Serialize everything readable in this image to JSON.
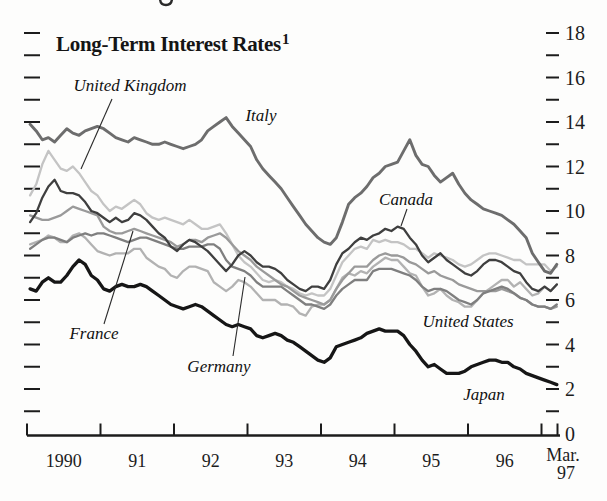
{
  "chart_data": {
    "type": "line",
    "title": "Long-Term Interest Rates",
    "title_footnote_marker": "1",
    "x_axis": {
      "year_labels": [
        "1990",
        "91",
        "92",
        "93",
        "94",
        "95",
        "96"
      ],
      "end_label_top": "Mar.",
      "end_label_bottom": "97",
      "months_shown": 87,
      "range": "Jan 1990 - Mar 1997"
    },
    "y_axis": {
      "min": 0,
      "max": 18,
      "minor_step": 1,
      "major_step": 2,
      "labels_side": "right",
      "labels": [
        "18",
        "16",
        "14",
        "12",
        "10",
        "8",
        "6",
        "4",
        "2",
        "0"
      ]
    },
    "series": [
      {
        "name": "united-kingdom",
        "label": "United Kingdom",
        "color": "#c4c4c4",
        "stroke_width": 2.3,
        "values": [
          10.7,
          11.2,
          12.1,
          12.7,
          12.3,
          11.9,
          11.8,
          12.0,
          11.7,
          11.3,
          10.9,
          10.7,
          10.3,
          10.0,
          10.2,
          10.1,
          10.3,
          10.5,
          10.3,
          9.9,
          9.7,
          9.6,
          9.7,
          9.6,
          9.5,
          9.4,
          9.6,
          9.4,
          9.2,
          9.2,
          9.3,
          9.4,
          9.0,
          8.5,
          8.0,
          7.7,
          7.5,
          7.2,
          6.9,
          6.8,
          6.9,
          6.8,
          6.6,
          6.5,
          6.3,
          6.2,
          6.3,
          6.2,
          6.2,
          6.5,
          7.1,
          7.7,
          8.0,
          8.3,
          8.4,
          8.3,
          8.7,
          8.6,
          8.7,
          8.6,
          8.6,
          8.5,
          8.3,
          8.3,
          8.1,
          7.9,
          8.1,
          8.0,
          7.9,
          7.8,
          7.6,
          7.5,
          7.6,
          7.8,
          8.0,
          8.1,
          8.1,
          8.0,
          7.9,
          7.8,
          7.8,
          7.6,
          7.6,
          7.6,
          7.6,
          7.3,
          7.5
        ]
      },
      {
        "name": "united-states",
        "label": "United States",
        "color": "#b2b2b2",
        "stroke_width": 2.3,
        "values": [
          8.5,
          8.6,
          8.7,
          8.9,
          8.8,
          8.6,
          8.6,
          8.9,
          9.0,
          8.8,
          8.5,
          8.2,
          8.1,
          8.0,
          8.1,
          8.1,
          8.1,
          8.3,
          8.3,
          7.9,
          7.7,
          7.5,
          7.4,
          7.1,
          7.0,
          7.3,
          7.5,
          7.5,
          7.4,
          7.3,
          6.8,
          6.6,
          6.4,
          6.6,
          6.9,
          6.8,
          6.6,
          6.3,
          6.0,
          6.0,
          6.0,
          5.8,
          5.8,
          5.7,
          5.4,
          5.3,
          5.7,
          5.8,
          5.8,
          6.0,
          6.5,
          7.0,
          7.2,
          7.1,
          7.3,
          7.2,
          7.5,
          7.7,
          7.9,
          7.8,
          7.8,
          7.5,
          7.2,
          7.1,
          6.6,
          6.2,
          6.3,
          6.5,
          6.2,
          6.0,
          5.9,
          5.7,
          5.7,
          6.0,
          6.3,
          6.5,
          6.7,
          6.9,
          6.9,
          6.6,
          6.8,
          6.5,
          6.2,
          6.3,
          6.6,
          6.4,
          6.7
        ]
      },
      {
        "name": "france",
        "label": "France",
        "color": "#9a9a9a",
        "stroke_width": 2.3,
        "values": [
          9.8,
          9.7,
          9.6,
          9.6,
          9.7,
          9.8,
          10.0,
          10.2,
          10.1,
          10.0,
          9.9,
          9.8,
          9.3,
          9.1,
          9.0,
          9.0,
          9.1,
          9.2,
          9.1,
          9.0,
          8.9,
          8.8,
          8.7,
          8.6,
          8.4,
          8.5,
          8.7,
          8.7,
          8.6,
          8.8,
          8.9,
          9.0,
          8.8,
          8.5,
          8.2,
          8.0,
          7.8,
          7.5,
          7.3,
          7.1,
          6.9,
          6.7,
          6.6,
          6.4,
          6.2,
          6.1,
          6.0,
          5.9,
          5.8,
          6.0,
          6.5,
          6.9,
          7.2,
          7.5,
          7.5,
          7.5,
          7.8,
          8.0,
          8.1,
          8.0,
          8.0,
          7.9,
          7.7,
          7.6,
          7.4,
          7.2,
          7.3,
          7.1,
          7.0,
          6.9,
          6.7,
          6.6,
          6.5,
          6.4,
          6.4,
          6.4,
          6.4,
          6.5,
          6.4,
          6.3,
          6.1,
          6.0,
          5.8,
          5.7,
          5.7,
          5.6,
          5.7
        ]
      },
      {
        "name": "germany",
        "label": "Germany",
        "color": "#7f7f7f",
        "stroke_width": 2.3,
        "values": [
          8.3,
          8.5,
          8.7,
          8.8,
          8.8,
          8.7,
          8.6,
          8.8,
          8.9,
          9.0,
          8.9,
          9.0,
          9.0,
          8.9,
          8.8,
          8.7,
          8.6,
          8.7,
          8.8,
          8.8,
          8.7,
          8.6,
          8.5,
          8.4,
          8.3,
          8.3,
          8.4,
          8.4,
          8.4,
          8.5,
          8.5,
          8.3,
          7.8,
          7.5,
          7.4,
          7.3,
          7.1,
          6.8,
          6.6,
          6.6,
          6.6,
          6.6,
          6.4,
          6.2,
          6.0,
          5.8,
          5.8,
          5.7,
          5.6,
          5.8,
          6.2,
          6.5,
          6.7,
          6.9,
          6.9,
          6.9,
          7.3,
          7.4,
          7.4,
          7.4,
          7.3,
          7.2,
          7.1,
          6.9,
          6.6,
          6.4,
          6.5,
          6.5,
          6.4,
          6.2,
          6.0,
          5.9,
          5.8,
          6.0,
          6.3,
          6.4,
          6.5,
          6.6,
          6.5,
          6.3,
          6.1,
          6.0,
          5.8,
          5.7,
          5.7,
          5.6,
          5.8
        ]
      },
      {
        "name": "canada",
        "label": "Canada",
        "color": "#3f3f3f",
        "stroke_width": 2.3,
        "values": [
          9.5,
          9.9,
          10.6,
          11.1,
          11.4,
          10.9,
          10.8,
          10.8,
          10.7,
          10.4,
          10.0,
          9.9,
          9.7,
          9.5,
          9.7,
          9.5,
          9.6,
          9.9,
          9.8,
          9.6,
          9.3,
          9.0,
          8.8,
          8.4,
          8.2,
          8.5,
          8.7,
          8.6,
          8.4,
          8.2,
          7.9,
          7.6,
          7.3,
          7.6,
          8.0,
          8.2,
          8.0,
          7.7,
          7.5,
          7.5,
          7.4,
          7.2,
          6.9,
          6.7,
          6.5,
          6.4,
          6.6,
          6.6,
          6.5,
          6.9,
          7.6,
          8.1,
          8.3,
          8.6,
          8.8,
          8.7,
          8.9,
          9.0,
          9.2,
          9.1,
          9.3,
          9.2,
          8.8,
          8.5,
          8.0,
          7.7,
          7.9,
          8.1,
          7.8,
          7.6,
          7.4,
          7.2,
          7.1,
          7.3,
          7.6,
          7.8,
          7.8,
          7.7,
          7.5,
          7.3,
          7.2,
          6.8,
          6.5,
          6.4,
          6.6,
          6.4,
          6.7
        ]
      },
      {
        "name": "italy",
        "label": "Italy",
        "color": "#6d6d6d",
        "stroke_width": 2.9,
        "values": [
          13.9,
          13.6,
          13.2,
          13.3,
          13.1,
          13.4,
          13.7,
          13.5,
          13.4,
          13.6,
          13.7,
          13.8,
          13.7,
          13.5,
          13.3,
          13.2,
          13.1,
          13.3,
          13.2,
          13.1,
          13.0,
          13.0,
          13.1,
          13.0,
          12.9,
          12.8,
          12.9,
          13.0,
          13.2,
          13.6,
          13.8,
          14.0,
          14.2,
          13.8,
          13.5,
          13.2,
          12.9,
          12.3,
          11.9,
          11.6,
          11.3,
          11.0,
          10.6,
          10.2,
          9.8,
          9.4,
          9.1,
          8.8,
          8.6,
          8.5,
          8.8,
          9.5,
          10.3,
          10.6,
          10.8,
          11.1,
          11.5,
          11.7,
          12.0,
          12.1,
          12.2,
          12.7,
          13.2,
          12.5,
          12.1,
          12.0,
          11.6,
          11.3,
          11.5,
          11.7,
          11.2,
          10.8,
          10.5,
          10.3,
          10.1,
          10.0,
          9.9,
          9.8,
          9.6,
          9.4,
          9.1,
          8.8,
          8.1,
          7.7,
          7.3,
          7.2,
          7.6
        ]
      },
      {
        "name": "japan",
        "label": "Japan",
        "color": "#161616",
        "stroke_width": 3.3,
        "values": [
          6.5,
          6.4,
          6.8,
          7.0,
          6.8,
          6.8,
          7.1,
          7.5,
          7.8,
          7.6,
          7.1,
          6.9,
          6.5,
          6.4,
          6.6,
          6.7,
          6.6,
          6.6,
          6.7,
          6.6,
          6.4,
          6.2,
          6.0,
          5.8,
          5.7,
          5.6,
          5.7,
          5.8,
          5.7,
          5.5,
          5.3,
          5.1,
          4.9,
          4.8,
          4.9,
          4.8,
          4.7,
          4.4,
          4.3,
          4.4,
          4.5,
          4.4,
          4.2,
          4.1,
          3.9,
          3.7,
          3.5,
          3.3,
          3.2,
          3.4,
          3.9,
          4.0,
          4.1,
          4.2,
          4.3,
          4.5,
          4.6,
          4.7,
          4.6,
          4.6,
          4.6,
          4.4,
          4.0,
          3.7,
          3.3,
          3.0,
          3.1,
          2.9,
          2.7,
          2.7,
          2.7,
          2.8,
          3.0,
          3.1,
          3.2,
          3.3,
          3.3,
          3.2,
          3.2,
          3.0,
          2.9,
          2.7,
          2.6,
          2.5,
          2.4,
          2.3,
          2.2
        ]
      }
    ],
    "annotations": [
      {
        "series": "united-kingdom",
        "text": "United Kingdom",
        "x": 130,
        "y": 91,
        "callout": [
          112,
          99,
          81,
          169
        ]
      },
      {
        "series": "italy",
        "text": "Italy",
        "x": 261,
        "y": 121,
        "callout": null
      },
      {
        "series": "canada",
        "text": "Canada",
        "x": 406,
        "y": 205,
        "callout": [
          407,
          209,
          401,
          226
        ]
      },
      {
        "series": "france",
        "text": "France",
        "x": 94,
        "y": 339,
        "callout": [
          104,
          324,
          133,
          231
        ]
      },
      {
        "series": "germany",
        "text": "Germany",
        "x": 219,
        "y": 372,
        "callout": [
          233,
          356,
          245,
          277
        ]
      },
      {
        "series": "united-states",
        "text": "United States",
        "x": 468,
        "y": 327,
        "callout": null
      },
      {
        "series": "japan",
        "text": "Japan",
        "x": 484,
        "y": 400,
        "callout": null
      }
    ],
    "layout": {
      "plot_left_px": 27,
      "year_width_px": 73.5,
      "baseline_y_px": 435.5,
      "y_zero_px": 433.5,
      "px_per_unit": 22.25,
      "left_tick_x": [
        24,
        40
      ],
      "right_tick_x": [
        546,
        559
      ],
      "right_label_x": 565,
      "year_label_y": 467,
      "grid": "off",
      "legend": "inline annotations with callout lines"
    }
  }
}
